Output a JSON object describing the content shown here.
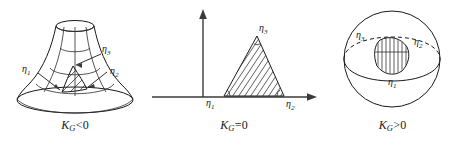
{
  "figure": {
    "background_color": "#ffffff",
    "ink_color": "#1a1a1a",
    "panels": [
      {
        "id": "negative",
        "caption_symbol": "K",
        "caption_subscript": "G",
        "caption_relation": "<0",
        "caption_full": "KG<0",
        "surface": "hyperboloid-trumpet",
        "triangle_fill": "diagonal-hatch",
        "vertex_labels": [
          {
            "symbol": "η",
            "index": "1"
          },
          {
            "symbol": "η",
            "index": "2"
          },
          {
            "symbol": "η",
            "index": "3"
          }
        ]
      },
      {
        "id": "zero",
        "caption_symbol": "K",
        "caption_subscript": "G",
        "caption_relation": "=0",
        "caption_full": "KG=0",
        "surface": "plane",
        "triangle_fill": "diagonal-hatch",
        "vertex_labels": [
          {
            "symbol": "η",
            "index": "1"
          },
          {
            "symbol": "η",
            "index": "2"
          },
          {
            "symbol": "η",
            "index": "3"
          }
        ]
      },
      {
        "id": "positive",
        "caption_symbol": "K",
        "caption_subscript": "G",
        "caption_relation": ">0",
        "caption_full": "KG>0",
        "surface": "sphere",
        "triangle_fill": "vertical-hatch",
        "vertex_labels": [
          {
            "symbol": "η",
            "index": "1"
          },
          {
            "symbol": "η",
            "index": "2"
          },
          {
            "symbol": "η",
            "index": "3"
          }
        ]
      }
    ]
  }
}
